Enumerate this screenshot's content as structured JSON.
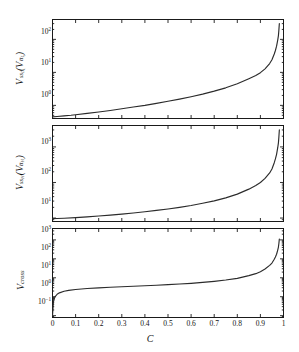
{
  "figure": {
    "background": "#ffffff",
    "axis_color": "#1a1a1a",
    "curve_color": "#2b2b2b",
    "xlabel": "C",
    "xtick_labels": [
      "0",
      "0.1",
      "0.2",
      "0.3",
      "0.4",
      "0.5",
      "0.6",
      "0.7",
      "0.8",
      "0.9",
      "1"
    ],
    "xtick_values": [
      0,
      0.1,
      0.2,
      0.3,
      0.4,
      0.5,
      0.6,
      0.7,
      0.8,
      0.9,
      1
    ]
  },
  "chart_data": [
    {
      "type": "line",
      "panel": "top",
      "title": "",
      "xlabel": "",
      "ylabel": "V_{s s_L}(V_{t t_L})",
      "ylabel_base": "V",
      "ylabel_sub": "ss",
      "ylabel_sub2": "L",
      "ylabel_paren_base": "V",
      "ylabel_paren_sub": "tt",
      "ylabel_paren_sub2": "L",
      "xlim": [
        0,
        1
      ],
      "ylim": [
        0.4,
        400
      ],
      "yscale": "log",
      "ytick_values": [
        1,
        10,
        100
      ],
      "ytick_labels": [
        "10⁰",
        "10¹",
        "10²"
      ],
      "grid": false,
      "legend": null,
      "x": [
        0,
        0.02,
        0.05,
        0.08,
        0.1,
        0.15,
        0.2,
        0.25,
        0.3,
        0.35,
        0.4,
        0.45,
        0.5,
        0.55,
        0.6,
        0.65,
        0.7,
        0.75,
        0.8,
        0.85,
        0.88,
        0.9,
        0.92,
        0.94,
        0.95,
        0.96,
        0.965,
        0.97,
        0.975,
        0.978,
        0.98,
        0.982
      ],
      "y": [
        0.45,
        0.46,
        0.48,
        0.5,
        0.52,
        0.57,
        0.63,
        0.7,
        0.79,
        0.89,
        1.0,
        1.15,
        1.33,
        1.55,
        1.83,
        2.2,
        2.7,
        3.4,
        4.5,
        6.4,
        8.0,
        9.8,
        12.8,
        18.5,
        24.0,
        36.0,
        46.0,
        62.0,
        95.0,
        130.0,
        190.0,
        300.0
      ]
    },
    {
      "type": "line",
      "panel": "middle",
      "title": "",
      "xlabel": "",
      "ylabel": "V_{s s_H}(V_{t t_H})",
      "ylabel_base": "V",
      "ylabel_sub": "ss",
      "ylabel_sub2": "H",
      "ylabel_paren_base": "V",
      "ylabel_paren_sub": "tt",
      "ylabel_paren_sub2": "H",
      "xlim": [
        0,
        1
      ],
      "ylim": [
        8,
        4000
      ],
      "yscale": "log",
      "ytick_values": [
        10,
        100,
        1000
      ],
      "ytick_labels": [
        "10¹",
        "10²",
        "10³"
      ],
      "grid": false,
      "legend": null,
      "x": [
        0,
        0.02,
        0.05,
        0.1,
        0.15,
        0.2,
        0.25,
        0.3,
        0.35,
        0.4,
        0.45,
        0.5,
        0.55,
        0.6,
        0.65,
        0.7,
        0.75,
        0.8,
        0.85,
        0.88,
        0.9,
        0.92,
        0.94,
        0.95,
        0.96,
        0.965,
        0.97,
        0.975,
        0.978,
        0.98,
        0.982
      ],
      "y": [
        9.6,
        9.7,
        9.9,
        10.3,
        10.8,
        11.4,
        12.1,
        12.9,
        13.9,
        15.0,
        16.4,
        18.0,
        20.0,
        22.5,
        26.0,
        30.5,
        37.0,
        47.0,
        65.0,
        82.0,
        100.0,
        130.0,
        185.0,
        240.0,
        360.0,
        460.0,
        620.0,
        950.0,
        1300.0,
        1900.0,
        3000.0
      ]
    },
    {
      "type": "line",
      "panel": "bottom",
      "title": "",
      "xlabel": "C",
      "ylabel": "V_{cross}",
      "ylabel_base": "V",
      "ylabel_sub": "cross",
      "xlim": [
        0,
        1
      ],
      "ylim": [
        0.08,
        4000
      ],
      "yscale": "log",
      "ytick_values": [
        0.1,
        1,
        10,
        100,
        1000
      ],
      "ytick_labels": [
        "10⁻¹",
        "10⁰",
        "10¹",
        "10²",
        "10³"
      ],
      "grid": false,
      "legend": null,
      "x": [
        0,
        0.004,
        0.01,
        0.02,
        0.03,
        0.05,
        0.07,
        0.1,
        0.15,
        0.2,
        0.25,
        0.3,
        0.35,
        0.4,
        0.45,
        0.5,
        0.55,
        0.6,
        0.65,
        0.7,
        0.75,
        0.8,
        0.85,
        0.88,
        0.9,
        0.92,
        0.94,
        0.95,
        0.96,
        0.965,
        0.97,
        0.975,
        0.978,
        0.98,
        0.982
      ],
      "y": [
        0.1,
        0.55,
        0.95,
        1.35,
        1.6,
        1.95,
        2.15,
        2.4,
        2.7,
        2.95,
        3.15,
        3.35,
        3.55,
        3.8,
        4.05,
        4.35,
        4.7,
        5.1,
        5.7,
        6.5,
        7.6,
        9.3,
        13.0,
        16.5,
        21.0,
        29.0,
        45.0,
        60.0,
        95.0,
        125.0,
        175.0,
        290.0,
        420.0,
        650.0,
        1100.0
      ]
    }
  ]
}
